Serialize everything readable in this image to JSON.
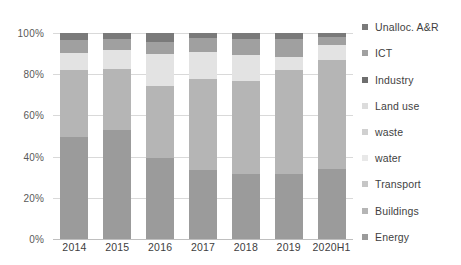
{
  "chart_data": {
    "type": "bar",
    "subtype": "stacked-100-percent",
    "title": "",
    "xlabel": "",
    "ylabel": "",
    "categories": [
      "2014",
      "2015",
      "2016",
      "2017",
      "2018",
      "2019",
      "2020H1"
    ],
    "ylim": [
      0,
      100
    ],
    "ytick_labels": [
      "0%",
      "20%",
      "40%",
      "60%",
      "80%",
      "100%"
    ],
    "ytick_values": [
      0,
      20,
      40,
      60,
      80,
      100
    ],
    "grid": true,
    "legend_position": "right",
    "legend_order_top_to_bottom": [
      "Unalloc. A&R",
      "ICT",
      "Industry",
      "Land use",
      "waste",
      "water",
      "Transport",
      "Buildings",
      "Energy"
    ],
    "stack_order_bottom_to_top": [
      "Energy",
      "Buildings",
      "Transport",
      "water",
      "waste",
      "Land use",
      "Industry",
      "ICT",
      "Unalloc. A&R"
    ],
    "series": [
      {
        "name": "Energy",
        "color": "#9b9b9b",
        "values": [
          49.5,
          53.0,
          39.5,
          33.5,
          31.5,
          31.5,
          34.0
        ]
      },
      {
        "name": "Buildings",
        "color": "#b5b5b5",
        "values": [
          32.5,
          29.5,
          35.0,
          44.0,
          45.0,
          50.5,
          53.0
        ]
      },
      {
        "name": "Transport",
        "color": "#c6c6c6",
        "values": [
          0.0,
          0.0,
          0.0,
          0.0,
          0.0,
          0.0,
          0.0
        ]
      },
      {
        "name": "water",
        "color": "#e3e3e3",
        "values": [
          8.5,
          9.5,
          15.5,
          13.5,
          13.0,
          6.5,
          7.0
        ]
      },
      {
        "name": "waste",
        "color": "#d0d0d0",
        "values": [
          0.0,
          0.0,
          0.0,
          0.0,
          0.0,
          0.0,
          0.0
        ]
      },
      {
        "name": "Land use",
        "color": "#dcdcdc",
        "values": [
          0.0,
          0.0,
          0.0,
          0.0,
          0.0,
          0.0,
          0.0
        ]
      },
      {
        "name": "Industry",
        "color": "#6e6e6e",
        "values": [
          0.0,
          0.0,
          0.0,
          0.0,
          0.0,
          0.0,
          0.0
        ]
      },
      {
        "name": "ICT",
        "color": "#a0a0a0",
        "values": [
          6.0,
          5.0,
          5.5,
          6.5,
          7.5,
          8.5,
          4.0
        ]
      },
      {
        "name": "Unalloc. A&R",
        "color": "#7a7a7a",
        "values": [
          3.5,
          3.0,
          4.5,
          2.5,
          3.0,
          3.0,
          2.0
        ]
      }
    ]
  },
  "legend": {
    "items": [
      {
        "label": "Unalloc. A&R",
        "color": "#7a7a7a",
        "swatch": "legend-swatch-unalloc"
      },
      {
        "label": "ICT",
        "color": "#a0a0a0",
        "swatch": "legend-swatch-ict"
      },
      {
        "label": "Industry",
        "color": "#6e6e6e",
        "swatch": "legend-swatch-industry"
      },
      {
        "label": "Land use",
        "color": "#dcdcdc",
        "swatch": "legend-swatch-land-use"
      },
      {
        "label": "waste",
        "color": "#d0d0d0",
        "swatch": "legend-swatch-waste"
      },
      {
        "label": "water",
        "color": "#e8e8e8",
        "swatch": "legend-swatch-water"
      },
      {
        "label": "Transport",
        "color": "#c6c6c6",
        "swatch": "legend-swatch-transport"
      },
      {
        "label": "Buildings",
        "color": "#b5b5b5",
        "swatch": "legend-swatch-buildings"
      },
      {
        "label": "Energy",
        "color": "#9b9b9b",
        "swatch": "legend-swatch-energy"
      }
    ]
  },
  "axes": {
    "y_ticks": [
      "100%",
      "80%",
      "60%",
      "40%",
      "20%",
      "0%"
    ],
    "x_ticks": [
      "2014",
      "2015",
      "2016",
      "2017",
      "2018",
      "2019",
      "2020H1"
    ]
  },
  "colors": {
    "gridline": "#d9d9d9",
    "axis": "#bfbfbf",
    "text": "#3f3f3f",
    "background": "#ffffff"
  }
}
